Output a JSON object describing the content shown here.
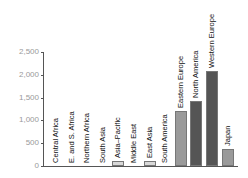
{
  "chart_data": {
    "type": "bar",
    "title": "",
    "xlabel": "",
    "ylabel": "",
    "ylim": [
      0,
      2500
    ],
    "yticks": [
      0,
      500,
      1000,
      1500,
      2000,
      2500
    ],
    "ytick_labels": [
      "0",
      "500",
      "1,000",
      "1,500",
      "2,000",
      "2,500"
    ],
    "grid": false,
    "legend": null,
    "categories": [
      "Central Africa",
      "E. and S. Africa",
      "Northern Africa",
      "South Asia",
      "Asia–Pacific",
      "Middle East",
      "East Asia",
      "South America",
      "Eastern Europe",
      "North America",
      "Western Europe",
      "Japan"
    ],
    "values": [
      0,
      0,
      0,
      0,
      100,
      0,
      110,
      0,
      1210,
      1430,
      2080,
      370
    ],
    "colors": [
      "#d8d8d8",
      "#d8d8d8",
      "#d8d8d8",
      "#d8d8d8",
      "#d8d8d8",
      "#d8d8d8",
      "#d8d8d8",
      "#d8d8d8",
      "#9a9a9a",
      "#555555",
      "#555555",
      "#9a9a9a"
    ]
  }
}
